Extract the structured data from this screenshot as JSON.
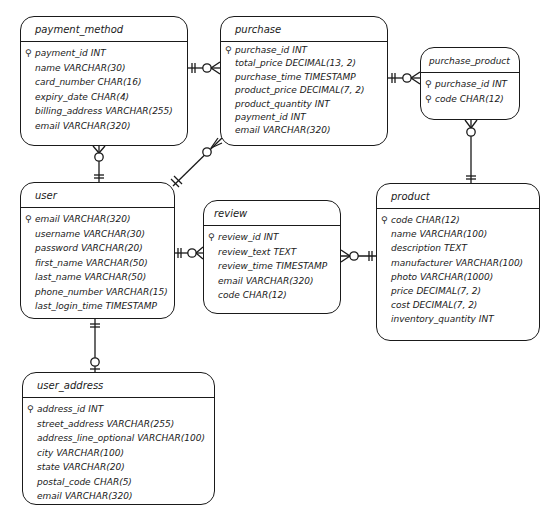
{
  "diagram": {
    "type": "entity-relationship",
    "entities": [
      {
        "id": "payment_method",
        "title": "payment_method",
        "box": {
          "x": 20,
          "y": 16,
          "w": 168,
          "h": 130
        },
        "fields": [
          {
            "name": "payment_id",
            "type": "INT",
            "pk": true
          },
          {
            "name": "name",
            "type": "VARCHAR(30)",
            "pk": false
          },
          {
            "name": "card_number",
            "type": "CHAR(16)",
            "pk": false
          },
          {
            "name": "expiry_date",
            "type": "CHAR(4)",
            "pk": false
          },
          {
            "name": "billing_address",
            "type": "VARCHAR(255)",
            "pk": false
          },
          {
            "name": "email",
            "type": "VARCHAR(320)",
            "pk": false
          }
        ]
      },
      {
        "id": "purchase",
        "title": "purchase",
        "box": {
          "x": 220,
          "y": 16,
          "w": 168,
          "h": 130
        },
        "fields": [
          {
            "name": "purchase_id",
            "type": "INT",
            "pk": true
          },
          {
            "name": "total_price",
            "type": "DECIMAL(13, 2)",
            "pk": false
          },
          {
            "name": "purchase_time",
            "type": "TIMESTAMP",
            "pk": false
          },
          {
            "name": "product_price",
            "type": "DECIMAL(7, 2)",
            "pk": false
          },
          {
            "name": "product_quantity",
            "type": "INT",
            "pk": false
          },
          {
            "name": "payment_id",
            "type": "INT",
            "pk": false
          },
          {
            "name": "email",
            "type": "VARCHAR(320)",
            "pk": false
          }
        ]
      },
      {
        "id": "purchase_product",
        "title": "purchase_product",
        "box": {
          "x": 420,
          "y": 47,
          "w": 100,
          "h": 73
        },
        "fields": [
          {
            "name": "purchase_id",
            "type": "INT",
            "pk": true
          },
          {
            "name": "code",
            "type": "CHAR(12)",
            "pk": true
          }
        ]
      },
      {
        "id": "user",
        "title": "user",
        "box": {
          "x": 20,
          "y": 182,
          "w": 155,
          "h": 137
        },
        "fields": [
          {
            "name": "email",
            "type": "VARCHAR(320)",
            "pk": true
          },
          {
            "name": "username",
            "type": "VARCHAR(30)",
            "pk": false
          },
          {
            "name": "password",
            "type": "VARCHAR(20)",
            "pk": false
          },
          {
            "name": "first_name",
            "type": "VARCHAR(50)",
            "pk": false
          },
          {
            "name": "last_name",
            "type": "VARCHAR(50)",
            "pk": false
          },
          {
            "name": "phone_number",
            "type": "VARCHAR(15)",
            "pk": false
          },
          {
            "name": "last_login_time",
            "type": "TIMESTAMP",
            "pk": false
          }
        ]
      },
      {
        "id": "review",
        "title": "review",
        "box": {
          "x": 203,
          "y": 200,
          "w": 138,
          "h": 114
        },
        "fields": [
          {
            "name": "review_id",
            "type": "INT",
            "pk": true
          },
          {
            "name": "review_text",
            "type": "TEXT",
            "pk": false
          },
          {
            "name": "review_time",
            "type": "TIMESTAMP",
            "pk": false
          },
          {
            "name": "email",
            "type": "VARCHAR(320)",
            "pk": false
          },
          {
            "name": "code",
            "type": "CHAR(12)",
            "pk": false
          }
        ]
      },
      {
        "id": "product",
        "title": "product",
        "box": {
          "x": 376,
          "y": 183,
          "w": 164,
          "h": 158
        },
        "fields": [
          {
            "name": "code",
            "type": "CHAR(12)",
            "pk": true
          },
          {
            "name": "name",
            "type": "VARCHAR(100)",
            "pk": false
          },
          {
            "name": "description",
            "type": "TEXT",
            "pk": false
          },
          {
            "name": "manufacturer",
            "type": "VARCHAR(100)",
            "pk": false
          },
          {
            "name": "photo",
            "type": "VARCHAR(1000)",
            "pk": false
          },
          {
            "name": "price",
            "type": "DECIMAL(7, 2)",
            "pk": false
          },
          {
            "name": "cost",
            "type": "DECIMAL(7, 2)",
            "pk": false
          },
          {
            "name": "inventory_quantity",
            "type": "INT",
            "pk": false
          }
        ]
      },
      {
        "id": "user_address",
        "title": "user_address",
        "box": {
          "x": 22,
          "y": 372,
          "w": 193,
          "h": 133
        },
        "fields": [
          {
            "name": "address_id",
            "type": "INT",
            "pk": true
          },
          {
            "name": "street_address",
            "type": "VARCHAR(255)",
            "pk": false
          },
          {
            "name": "address_line_optional",
            "type": "VARCHAR(100)",
            "pk": false
          },
          {
            "name": "city",
            "type": "VARCHAR(100)",
            "pk": false
          },
          {
            "name": "state",
            "type": "VARCHAR(20)",
            "pk": false
          },
          {
            "name": "postal_code",
            "type": "CHAR(5)",
            "pk": false
          },
          {
            "name": "email",
            "type": "VARCHAR(320)",
            "pk": false
          }
        ]
      }
    ],
    "relationships": [
      {
        "from": "payment_method",
        "to": "purchase",
        "from_cardinality": "exactly-one",
        "to_cardinality": "zero-or-many"
      },
      {
        "from": "purchase",
        "to": "purchase_product",
        "from_cardinality": "exactly-one",
        "to_cardinality": "zero-or-many"
      },
      {
        "from": "product",
        "to": "purchase_product",
        "from_cardinality": "exactly-one",
        "to_cardinality": "zero-or-many"
      },
      {
        "from": "user",
        "to": "payment_method",
        "from_cardinality": "exactly-one",
        "to_cardinality": "zero-or-many"
      },
      {
        "from": "user",
        "to": "purchase",
        "from_cardinality": "exactly-one",
        "to_cardinality": "zero-or-many"
      },
      {
        "from": "user",
        "to": "review",
        "from_cardinality": "exactly-one",
        "to_cardinality": "zero-or-many"
      },
      {
        "from": "product",
        "to": "review",
        "from_cardinality": "exactly-one",
        "to_cardinality": "zero-or-many"
      },
      {
        "from": "user",
        "to": "user_address",
        "from_cardinality": "exactly-one",
        "to_cardinality": "zero-or-one"
      }
    ],
    "key_icon": "key-icon",
    "colors": {
      "stroke": "#1a1a1a",
      "background": "#ffffff"
    }
  }
}
